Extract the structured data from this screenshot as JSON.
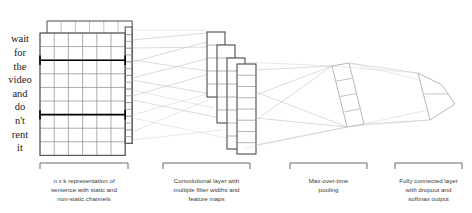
{
  "figure": {
    "width": 472,
    "height": 213,
    "background": "#ffffff"
  },
  "sentence": {
    "words": [
      "wait",
      "for",
      "the",
      "video",
      "and",
      "do",
      "n't",
      "rent",
      "it"
    ],
    "rows": 9,
    "cols": 6,
    "channels": 2
  },
  "stages": [
    {
      "id": "embedding",
      "caption_lines": [
        "n x k representation of",
        "sentence with static and",
        "non-static channels"
      ],
      "bracket": {
        "x1": 40,
        "x2": 128,
        "y": 163
      }
    },
    {
      "id": "convolution",
      "caption_lines": [
        "Convolutional layer with",
        "multiple filter widths and",
        "feature maps"
      ],
      "bracket": {
        "x1": 163,
        "x2": 250,
        "y": 163
      }
    },
    {
      "id": "pooling",
      "caption_lines": [
        "Max-over-time",
        "pooling"
      ],
      "bracket": {
        "x1": 290,
        "x2": 367,
        "y": 163
      }
    },
    {
      "id": "output",
      "caption_lines": [
        "Fully connected layer",
        "with dropout and",
        "softmax output"
      ],
      "bracket": {
        "x1": 395,
        "x2": 462,
        "y": 163
      }
    }
  ],
  "feature_maps": [
    {
      "id": "filter-map-1",
      "cells": 5
    },
    {
      "id": "filter-map-2",
      "cells": 6
    },
    {
      "id": "filter-map-3",
      "cells": 7
    },
    {
      "id": "filter-map-4",
      "cells": 8
    }
  ],
  "pooling_layer": {
    "id": "pool-column",
    "cells": 4
  },
  "output_layer": {
    "id": "softmax-column",
    "cells": 2
  },
  "colors": {
    "grid_line": "#8a8a8a",
    "grid_outline": "#555555",
    "region_highlight": "#000000",
    "feature_map_stroke": "#4a4a4a",
    "connector": "#b8b8b8",
    "caption": "#3a3a3a",
    "word": "#1a1a1a"
  }
}
